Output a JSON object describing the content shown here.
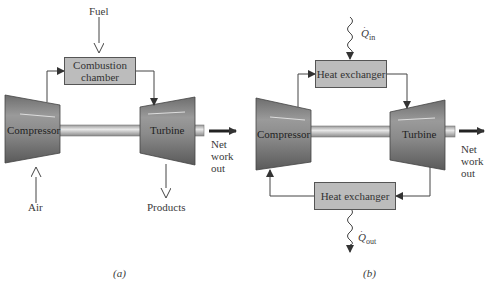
{
  "diagram_a": {
    "fuel": "Fuel",
    "combustion_line1": "Combustion",
    "combustion_line2": "chamber",
    "compressor": "Compressor",
    "turbine": "Turbine",
    "net1": "Net",
    "net2": "work",
    "net3": "out",
    "air": "Air",
    "products": "Products",
    "caption": "(a)"
  },
  "diagram_b": {
    "q_in": "Q",
    "q_in_sub": "in",
    "hx_top": "Heat exchanger",
    "hx_bottom": "Heat exchanger",
    "compressor": "Compressor",
    "turbine": "Turbine",
    "net1": "Net",
    "net2": "work",
    "net3": "out",
    "q_out": "Q",
    "q_out_sub": "out",
    "caption": "(b)"
  }
}
